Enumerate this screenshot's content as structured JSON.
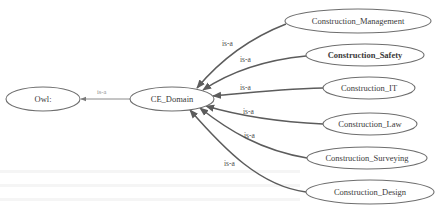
{
  "diagram": {
    "type": "ontology-class-hierarchy",
    "root": {
      "id": "owl",
      "label": "Owl:"
    },
    "domain": {
      "id": "ce_domain",
      "label": "CE_Domain"
    },
    "root_edge": {
      "from": "ce_domain",
      "to": "owl",
      "label": "is-a"
    },
    "subclasses": [
      {
        "id": "management",
        "label": "Construction_Management",
        "edge_label": "is-a"
      },
      {
        "id": "safety",
        "label": "Construction_Safety",
        "edge_label": "is-a"
      },
      {
        "id": "it",
        "label": "Construction_IT",
        "edge_label": "is-a"
      },
      {
        "id": "law",
        "label": "Construction_Law",
        "edge_label": "is-a"
      },
      {
        "id": "surveying",
        "label": "Construction_Surveying",
        "edge_label": "is-a"
      },
      {
        "id": "design",
        "label": "Construction_Design",
        "edge_label": "is-a"
      }
    ],
    "colors": {
      "node_stroke": "#6e6e6e",
      "edge": "#5c5c5c",
      "text": "#3a3a3a",
      "background": "#ffffff"
    }
  }
}
